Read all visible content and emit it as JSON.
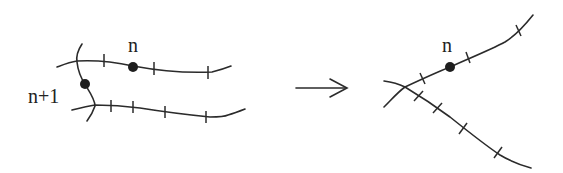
{
  "diagram": {
    "left": {
      "labels": {
        "upper_point": "n",
        "lower_point": "n+1"
      }
    },
    "transition": {
      "arrow": "right-arrow"
    },
    "right": {
      "labels": {
        "point": "n"
      }
    },
    "colors": {
      "stroke": "#2b2b2b",
      "dot": "#1e1e1e",
      "background": "#ffffff"
    }
  }
}
